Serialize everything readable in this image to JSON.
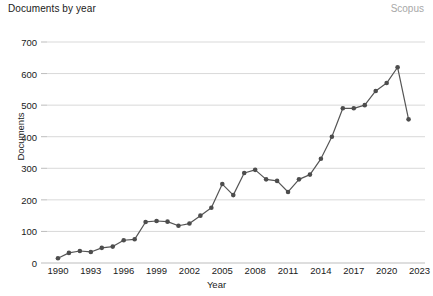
{
  "header": {
    "title": "Documents by year",
    "watermark": "Scopus"
  },
  "chart_data": {
    "type": "line",
    "title": "Documents by year",
    "xlabel": "Year",
    "ylabel": "Documents",
    "xlim": [
      1989,
      2023.5
    ],
    "ylim": [
      0,
      700
    ],
    "ytick_values": [
      0,
      100,
      200,
      300,
      400,
      500,
      600,
      700
    ],
    "ytick_labels": [
      "0",
      "100",
      "200",
      "300",
      "400",
      "500",
      "600",
      "700"
    ],
    "xtick_values": [
      1990,
      1993,
      1996,
      1999,
      2002,
      2005,
      2008,
      2011,
      2014,
      2017,
      2020,
      2023
    ],
    "xtick_labels": [
      "1990",
      "1993",
      "1996",
      "1999",
      "2002",
      "2005",
      "2008",
      "2011",
      "2014",
      "2017",
      "2020",
      "2023"
    ],
    "grid": "horizontal",
    "legend": "none",
    "marker": "circle",
    "line_color": "#555555",
    "marker_color": "#4d4d4d",
    "grid_color": "#d9d9d9",
    "x": [
      1990,
      1991,
      1992,
      1993,
      1994,
      1995,
      1996,
      1997,
      1998,
      1999,
      2000,
      2001,
      2002,
      2003,
      2004,
      2005,
      2006,
      2007,
      2008,
      2009,
      2010,
      2011,
      2012,
      2013,
      2014,
      2015,
      2016,
      2017,
      2018,
      2019,
      2020,
      2021,
      2022
    ],
    "values": [
      15,
      32,
      38,
      35,
      48,
      52,
      72,
      75,
      130,
      133,
      131,
      118,
      125,
      150,
      175,
      250,
      215,
      285,
      295,
      265,
      260,
      225,
      265,
      280,
      330,
      400,
      490,
      490,
      500,
      545,
      570,
      620,
      455
    ],
    "series": [
      {
        "name": "Documents",
        "values": [
          15,
          32,
          38,
          35,
          48,
          52,
          72,
          75,
          130,
          133,
          131,
          118,
          125,
          150,
          175,
          250,
          215,
          285,
          295,
          265,
          260,
          225,
          265,
          280,
          330,
          400,
          490,
          490,
          500,
          545,
          570,
          620,
          455
        ]
      }
    ]
  }
}
